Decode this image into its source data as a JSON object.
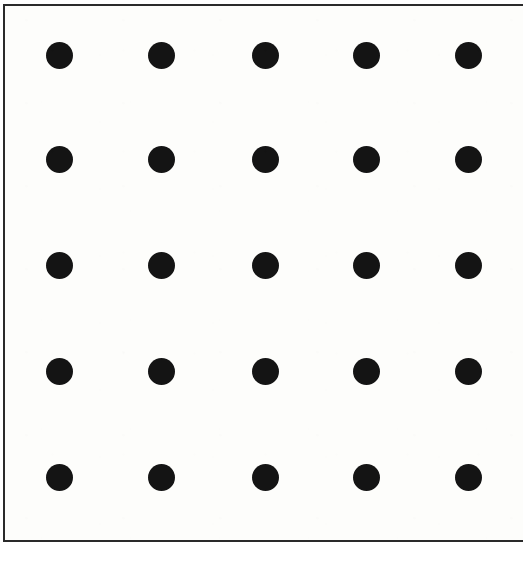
{
  "image": {
    "title": "Dot grid figure",
    "width": 519,
    "height": 561,
    "background_color": "#ffffff"
  },
  "frame": {
    "name": "bounding-rectangle",
    "x": 3,
    "y": 4,
    "width": 520,
    "height": 538,
    "stroke_color": "#2a2a2a",
    "stroke_width": 2,
    "fill_color": "#fdfdfb",
    "right_edge_cropped": true
  },
  "chart_data": {
    "type": "scatter",
    "title": "",
    "subtitle": "",
    "xlabel": "",
    "ylabel": "",
    "grid": false,
    "legend": null,
    "annotations": [],
    "rows": 5,
    "columns": 5,
    "point_count": 25,
    "marker": {
      "shape": "circle",
      "fill_color": "#141414",
      "diameter": 27
    },
    "column_centers_x": [
      59,
      161,
      265,
      366,
      468
    ],
    "row_centers_y": [
      55,
      159,
      265,
      371,
      477
    ],
    "column_spacing": 102,
    "row_spacing": 105,
    "x": [
      59,
      161,
      265,
      366,
      468,
      59,
      161,
      265,
      366,
      468,
      59,
      161,
      265,
      366,
      468,
      59,
      161,
      265,
      366,
      468,
      59,
      161,
      265,
      366,
      468
    ],
    "y": [
      55,
      55,
      55,
      55,
      55,
      159,
      159,
      159,
      159,
      159,
      265,
      265,
      265,
      265,
      265,
      371,
      371,
      371,
      371,
      371,
      477,
      477,
      477,
      477,
      477
    ],
    "xlim": [
      3,
      523
    ],
    "ylim": [
      4,
      542
    ]
  }
}
